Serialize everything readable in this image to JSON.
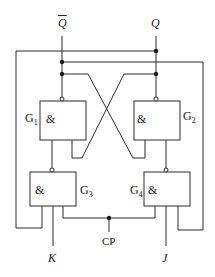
{
  "diagram": {
    "stroke_color": "#2a2a2a",
    "background": "#ffffff",
    "outputs": {
      "q_bar": {
        "label": "Q",
        "overline": true
      },
      "q": {
        "label": "Q"
      }
    },
    "gates": [
      {
        "id": "G1",
        "name": "G",
        "sub": "1",
        "symbol": "&",
        "type": "NAND"
      },
      {
        "id": "G2",
        "name": "G",
        "sub": "2",
        "symbol": "&",
        "type": "NAND"
      },
      {
        "id": "G3",
        "name": "G",
        "sub": "3",
        "symbol": "&",
        "type": "NAND"
      },
      {
        "id": "G4",
        "name": "G",
        "sub": "4",
        "symbol": "&",
        "type": "NAND"
      }
    ],
    "inputs": {
      "k": {
        "label": "K"
      },
      "j": {
        "label": "J"
      },
      "clock": {
        "label": "CP"
      }
    }
  }
}
